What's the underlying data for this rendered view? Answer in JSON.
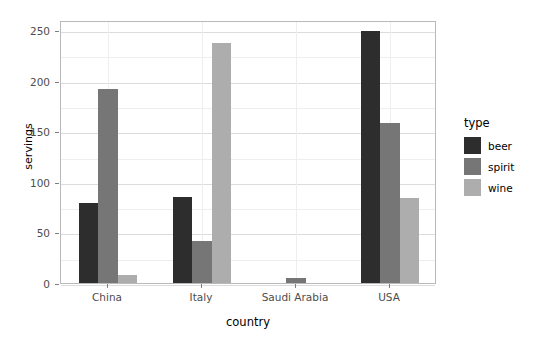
{
  "chart_data": {
    "type": "bar",
    "title": "",
    "subtitle": "",
    "xlabel": "country",
    "ylabel": "servings",
    "categories": [
      "China",
      "Italy",
      "Saudi Arabia",
      "USA"
    ],
    "series": [
      {
        "name": "beer",
        "color": "#2d2d2d",
        "values": [
          79,
          85,
          0,
          249
        ]
      },
      {
        "name": "spirit",
        "color": "#767676",
        "values": [
          192,
          42,
          5,
          158
        ]
      },
      {
        "name": "wine",
        "color": "#adadad",
        "values": [
          8,
          237,
          0,
          84
        ]
      }
    ],
    "ylim": [
      0,
      260
    ],
    "yticks": [
      0,
      50,
      100,
      150,
      200,
      250
    ],
    "ytick_labels": [
      "0",
      "50",
      "100",
      "150",
      "200",
      "250"
    ],
    "yminor": [
      25,
      75,
      125,
      175,
      225
    ],
    "grid": true,
    "legend": {
      "title": "type",
      "position": "right",
      "entries": [
        {
          "label": "beer",
          "color": "#2d2d2d"
        },
        {
          "label": "spirit",
          "color": "#767676"
        },
        {
          "label": "wine",
          "color": "#adadad"
        }
      ]
    },
    "panel": {
      "background": "#ffffff",
      "border_color": "#b9b9b9",
      "major_gridline_color": "#dcdcdc",
      "minor_gridline_color": "#eeeeee"
    }
  }
}
